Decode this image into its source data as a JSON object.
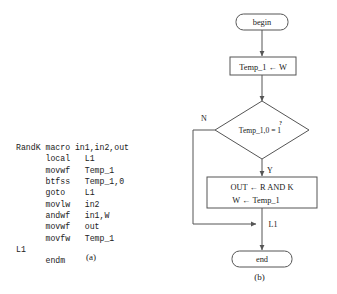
{
  "figure": {
    "panel_a": {
      "caption": "(a)",
      "code_lines": [
        "RandK macro in1,in2,out",
        "      local   L1",
        "      movwf   Temp_1",
        "      btfss   Temp_1,0",
        "      goto    L1",
        "      movlw   in2",
        "      andwf   in1,W",
        "      movwf   out",
        "      movfw   Temp_1",
        "L1",
        "      endm"
      ]
    },
    "panel_b": {
      "caption": "(b)",
      "nodes": {
        "begin": "begin",
        "assign_temp": "Temp_1 ← W",
        "decision": "Temp_1,0 = 1",
        "decision_qmark": "?",
        "process_line1": "OUT ← R AND K",
        "process_line2": "W ← Temp_1",
        "junction": "L1",
        "end": "end"
      },
      "edge_labels": {
        "no": "N",
        "yes": "Y"
      }
    }
  },
  "colors": {
    "background": "#ffffff",
    "stroke": "#555555",
    "text": "#1a1a1a"
  }
}
